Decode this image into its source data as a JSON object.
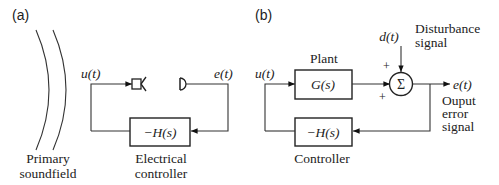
{
  "panel_a": {
    "tag": "(a)",
    "input_label": "u(t)",
    "error_label": "e(t)",
    "controller_block": "−H(s)",
    "soundfield_label_1": "Primary",
    "soundfield_label_2": "soundfield",
    "controller_label_1": "Electrical",
    "controller_label_2": "controller"
  },
  "panel_b": {
    "tag": "(b)",
    "input_label": "u(t)",
    "plant_label": "Plant",
    "plant_block": "G(s)",
    "sum_symbol": "Σ",
    "sum_sign_top": "+",
    "sum_sign_left": "+",
    "disturbance_symbol": "d(t)",
    "disturbance_label_1": "Disturbance",
    "disturbance_label_2": "signal",
    "output_label": "e(t)",
    "output_desc_1": "Ouput",
    "output_desc_2": "error",
    "output_desc_3": "signal",
    "controller_block": "−H(s)",
    "controller_label": "Controller"
  }
}
